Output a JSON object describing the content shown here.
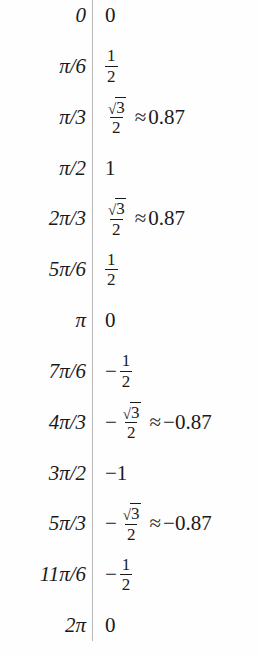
{
  "table": {
    "type": "math-value-table",
    "columns": 2,
    "divider": {
      "x": 92,
      "color": "#b8b8b8"
    },
    "text_color": "#1a1a1a",
    "background": "#fefefe",
    "row_count": 13,
    "rows": [
      {
        "angle": "0",
        "value_text": "0",
        "value_kind": "plain",
        "numeric": 0
      },
      {
        "angle": "π/6",
        "value_text": "1/2",
        "value_kind": "fraction",
        "numerator": "1",
        "denominator": "2",
        "negative": false,
        "numeric": 0.5
      },
      {
        "angle": "π/3",
        "value_text": "√3/2 ≈ 0.87",
        "value_kind": "radical-fraction-approx",
        "numerator": "3",
        "denominator": "2",
        "negative": false,
        "approx_symbol": "≈",
        "approx": "0.87",
        "numeric": 0.87
      },
      {
        "angle": "π/2",
        "value_text": "1",
        "value_kind": "plain",
        "numeric": 1
      },
      {
        "angle": "2π/3",
        "value_text": "√3/2 ≈ 0.87",
        "value_kind": "radical-fraction-approx",
        "numerator": "3",
        "denominator": "2",
        "negative": false,
        "approx_symbol": "≈",
        "approx": "0.87",
        "numeric": 0.87
      },
      {
        "angle": "5π/6",
        "value_text": "1/2",
        "value_kind": "fraction",
        "numerator": "1",
        "denominator": "2",
        "negative": false,
        "numeric": 0.5
      },
      {
        "angle": "π",
        "value_text": "0",
        "value_kind": "plain",
        "numeric": 0
      },
      {
        "angle": "7π/6",
        "value_text": "−1/2",
        "value_kind": "fraction",
        "numerator": "1",
        "denominator": "2",
        "negative": true,
        "minus_symbol": "−",
        "numeric": -0.5
      },
      {
        "angle": "4π/3",
        "value_text": "−√3/2 ≈ −0.87",
        "value_kind": "radical-fraction-approx",
        "numerator": "3",
        "denominator": "2",
        "negative": true,
        "minus_symbol": "−",
        "approx_symbol": "≈",
        "approx": "−0.87",
        "numeric": -0.87
      },
      {
        "angle": "3π/2",
        "value_text": "−1",
        "value_kind": "plain",
        "numeric": -1
      },
      {
        "angle": "5π/3",
        "value_text": "−√3/2 ≈ −0.87",
        "value_kind": "radical-fraction-approx",
        "numerator": "3",
        "denominator": "2",
        "negative": true,
        "minus_symbol": "−",
        "approx_symbol": "≈",
        "approx": "−0.87",
        "numeric": -0.87
      },
      {
        "angle": "11π/6",
        "value_text": "−1/2",
        "value_kind": "fraction",
        "numerator": "1",
        "denominator": "2",
        "negative": true,
        "minus_symbol": "−",
        "numeric": -0.5
      },
      {
        "angle": "2π",
        "value_text": "0",
        "value_kind": "plain",
        "numeric": 0
      }
    ]
  },
  "glyphs": {
    "radical": "√",
    "minus": "−",
    "approx": "≈"
  }
}
